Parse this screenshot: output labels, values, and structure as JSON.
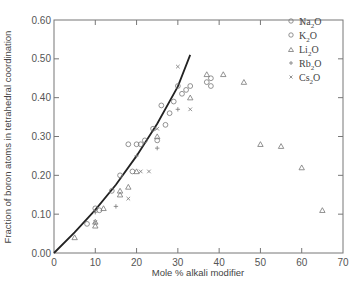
{
  "chart_data": {
    "type": "scatter",
    "title": "",
    "xlabel": "Mole % alkali modifier",
    "ylabel": "Fraction of boron atoms in tetrahedral coordination",
    "xlim": [
      0,
      70
    ],
    "ylim": [
      0.0,
      0.6
    ],
    "x_ticks": [
      0,
      10,
      20,
      30,
      40,
      50,
      60,
      70
    ],
    "x_tick_labels": [
      "0",
      "10",
      "20",
      "30",
      "40",
      "50",
      "60",
      "70"
    ],
    "y_ticks": [
      0.0,
      0.1,
      0.2,
      0.3,
      0.4,
      0.5,
      0.6
    ],
    "y_tick_labels": [
      "0.00",
      "0.10",
      "0.20",
      "0.30",
      "0.40",
      "0.50",
      "0.60"
    ],
    "grid": false,
    "legend_position": "upper right",
    "legend": [
      {
        "label": "Na2O",
        "marker": "circle"
      },
      {
        "label": "K2O",
        "marker": "circle"
      },
      {
        "label": "Li2O",
        "marker": "triangle"
      },
      {
        "label": "Rb2O",
        "marker": "plus"
      },
      {
        "label": "Cs2O",
        "marker": "x"
      }
    ],
    "curve": {
      "name": "theoretical x/(1-x)",
      "x": [
        0,
        5,
        10,
        15,
        20,
        25,
        30,
        33
      ],
      "y": [
        0.0,
        0.053,
        0.111,
        0.176,
        0.25,
        0.333,
        0.429,
        0.51
      ]
    },
    "series": [
      {
        "name": "Na2O",
        "marker": "circle",
        "points": [
          [
            8,
            0.075
          ],
          [
            10,
            0.115
          ],
          [
            14,
            0.16
          ],
          [
            18,
            0.28
          ],
          [
            20,
            0.28
          ],
          [
            22,
            0.29
          ],
          [
            26,
            0.38
          ],
          [
            28,
            0.36
          ],
          [
            30,
            0.43
          ],
          [
            32,
            0.42
          ],
          [
            38,
            0.45
          ],
          [
            38,
            0.43
          ]
        ]
      },
      {
        "name": "K2O",
        "marker": "circle",
        "points": [
          [
            11,
            0.11
          ],
          [
            16,
            0.2
          ],
          [
            19,
            0.21
          ],
          [
            21,
            0.28
          ],
          [
            24,
            0.32
          ],
          [
            25,
            0.29
          ],
          [
            27,
            0.33
          ],
          [
            29,
            0.39
          ],
          [
            31,
            0.41
          ],
          [
            33,
            0.43
          ],
          [
            37,
            0.44
          ]
        ]
      },
      {
        "name": "Li2O",
        "marker": "triangle",
        "points": [
          [
            5,
            0.04
          ],
          [
            10,
            0.07
          ],
          [
            10,
            0.08
          ],
          [
            12,
            0.115
          ],
          [
            16,
            0.15
          ],
          [
            16,
            0.16
          ],
          [
            18,
            0.17
          ],
          [
            20,
            0.21
          ],
          [
            25,
            0.3
          ],
          [
            33,
            0.4
          ],
          [
            37,
            0.46
          ],
          [
            41,
            0.46
          ],
          [
            46,
            0.44
          ],
          [
            50,
            0.28
          ],
          [
            55,
            0.275
          ],
          [
            60,
            0.22
          ],
          [
            65,
            0.11
          ]
        ]
      },
      {
        "name": "Rb2O",
        "marker": "plus",
        "points": [
          [
            10,
            0.105
          ],
          [
            15,
            0.12
          ],
          [
            20,
            0.25
          ],
          [
            25,
            0.27
          ],
          [
            30,
            0.37
          ]
        ]
      },
      {
        "name": "Cs2O",
        "marker": "x",
        "points": [
          [
            10,
            0.08
          ],
          [
            18,
            0.14
          ],
          [
            21,
            0.21
          ],
          [
            23,
            0.21
          ],
          [
            25,
            0.32
          ],
          [
            30,
            0.48
          ],
          [
            33,
            0.37
          ]
        ]
      }
    ]
  },
  "legend_labels": {
    "na": {
      "base": "Na",
      "sub": "2",
      "tail": "O"
    },
    "k": {
      "base": "K",
      "sub": "2",
      "tail": "O"
    },
    "li": {
      "base": "Li",
      "sub": "2",
      "tail": "O"
    },
    "rb": {
      "base": "Rb",
      "sub": "2",
      "tail": "O"
    },
    "cs": {
      "base": "Cs",
      "sub": "2",
      "tail": "O"
    }
  }
}
